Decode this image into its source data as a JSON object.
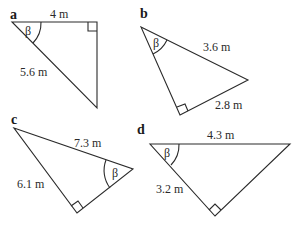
{
  "figure": {
    "triangles": [
      {
        "id": "a",
        "label": "a",
        "angle_symbol": "β",
        "sides": [
          {
            "name": "top",
            "text": "4 m"
          },
          {
            "name": "hypotenuse",
            "text": "5.6 m"
          }
        ],
        "right_angle_at": "top-right"
      },
      {
        "id": "b",
        "label": "b",
        "angle_symbol": "β",
        "sides": [
          {
            "name": "hypotenuse",
            "text": "3.6 m"
          },
          {
            "name": "bottom",
            "text": "2.8 m"
          }
        ],
        "right_angle_at": "bottom"
      },
      {
        "id": "c",
        "label": "c",
        "angle_symbol": "β",
        "sides": [
          {
            "name": "hypotenuse",
            "text": "7.3 m"
          },
          {
            "name": "left",
            "text": "6.1 m"
          }
        ],
        "right_angle_at": "bottom"
      },
      {
        "id": "d",
        "label": "d",
        "angle_symbol": "β",
        "sides": [
          {
            "name": "hypotenuse",
            "text": "4.3 m"
          },
          {
            "name": "left",
            "text": "3.2 m"
          }
        ],
        "right_angle_at": "bottom"
      }
    ]
  }
}
